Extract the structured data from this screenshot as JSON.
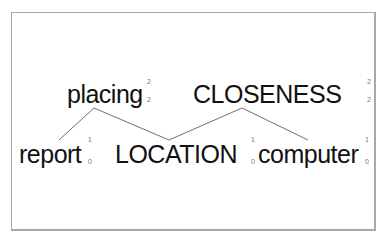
{
  "diagram": {
    "nodes": [
      {
        "id": "placing",
        "label": "placing",
        "sup": "2",
        "sub": "2"
      },
      {
        "id": "closeness",
        "label": "CLOSENESS",
        "sup": "2",
        "sub": "2"
      },
      {
        "id": "report",
        "label": "report",
        "sup": "1",
        "sub": "0"
      },
      {
        "id": "location",
        "label": "LOCATION",
        "sup": "1",
        "sub": "0"
      },
      {
        "id": "computer",
        "label": "computer",
        "sup": "1",
        "sub": "0"
      }
    ],
    "edges": [
      {
        "from": "placing",
        "to": "report"
      },
      {
        "from": "placing",
        "to": "location"
      },
      {
        "from": "closeness",
        "to": "location"
      },
      {
        "from": "closeness",
        "to": "computer"
      }
    ],
    "edge_color": "#707070"
  }
}
